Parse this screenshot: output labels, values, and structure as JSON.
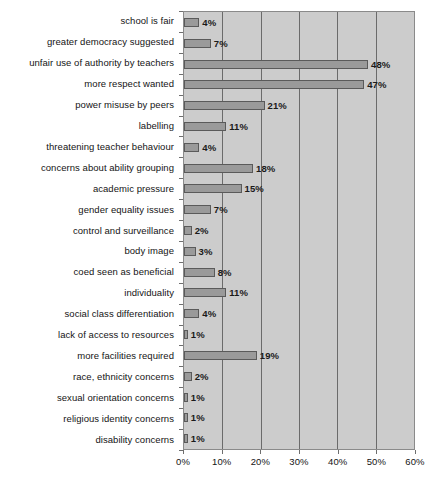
{
  "chart_data": {
    "type": "bar",
    "orientation": "horizontal",
    "title": "",
    "xlabel": "",
    "ylabel": "",
    "xlim": [
      0,
      60
    ],
    "grid": true,
    "legend": false,
    "tick_labels": [
      "0%",
      "10%",
      "20%",
      "30%",
      "40%",
      "50%",
      "60%"
    ],
    "tick_values": [
      0,
      10,
      20,
      30,
      40,
      50,
      60
    ],
    "categories": [
      "school is fair",
      "greater democracy suggested",
      "unfair use of authority by teachers",
      "more respect wanted",
      "power misuse by peers",
      "labelling",
      "threatening teacher behaviour",
      "concerns about ability grouping",
      "academic pressure",
      "gender equality issues",
      "control and surveillance",
      "body image",
      "coed seen as beneficial",
      "individuality",
      "social class differentiation",
      "lack of access to resources",
      "more facilities required",
      "race, ethnicity concerns",
      "sexual orientation concerns",
      "religious identity concerns",
      "disability concerns"
    ],
    "values": [
      4,
      7,
      48,
      47,
      21,
      11,
      4,
      18,
      15,
      7,
      2,
      3,
      8,
      11,
      4,
      1,
      19,
      2,
      1,
      1,
      1
    ],
    "value_labels": [
      "4%",
      "7%",
      "48%",
      "47%",
      "21%",
      "11%",
      "4%",
      "18%",
      "15%",
      "7%",
      "2%",
      "3%",
      "8%",
      "11%",
      "4%",
      "1%",
      "19%",
      "2%",
      "1%",
      "1%",
      "1%"
    ],
    "colors": {
      "bar_fill": "#9a9a9a",
      "bar_border": "#5a5a5a",
      "plot_background": "#cccccc",
      "gridline": "#6b6b6b",
      "axis": "#8a8a8a",
      "text": "#141414",
      "page_background": "#ffffff"
    }
  }
}
